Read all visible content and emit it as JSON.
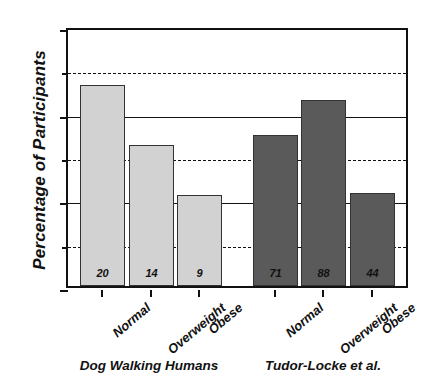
{
  "chart_data": {
    "type": "bar",
    "title": "",
    "xlabel": "",
    "ylabel": "Percentage of Participants",
    "ylim": [
      0,
      60
    ],
    "grid": "horizontal",
    "legend": "none",
    "categories": [
      "Normal",
      "Overweight",
      "Obese",
      "Normal",
      "Overweight",
      "Obese"
    ],
    "groups": [
      {
        "name": "Dog Walking Humans",
        "color": "#d2d2d2",
        "categories": [
          "Normal",
          "Overweight",
          "Obese"
        ],
        "values": [
          46.3,
          32.6,
          21.0
        ],
        "counts": [
          20,
          14,
          9
        ]
      },
      {
        "name": "Tudor-Locke et al.",
        "color": "#5a5a5a",
        "categories": [
          "Normal",
          "Overweight",
          "Obese"
        ],
        "values": [
          34.8,
          43.0,
          21.5
        ],
        "counts": [
          71,
          88,
          44
        ]
      }
    ],
    "series": [
      {
        "name": "Dog Walking Humans",
        "values": [
          46.3,
          32.6,
          21.0,
          null,
          null,
          null
        ]
      },
      {
        "name": "Tudor-Locke et al.",
        "values": [
          null,
          null,
          null,
          34.8,
          43.0,
          21.5
        ]
      }
    ],
    "y_ticks": [
      {
        "value": 0,
        "label": "0",
        "style": "solid"
      },
      {
        "value": 10,
        "label": "",
        "style": "dashed"
      },
      {
        "value": 20,
        "label": "20",
        "style": "solid"
      },
      {
        "value": 30,
        "label": "",
        "style": "dashed"
      },
      {
        "value": 40,
        "label": "40",
        "style": "solid"
      },
      {
        "value": 50,
        "label": "",
        "style": "dashed"
      },
      {
        "value": 60,
        "label": "60",
        "style": "solid"
      }
    ],
    "bar_labels": [
      "20",
      "14",
      "9",
      "71",
      "88",
      "44"
    ],
    "bars": [
      {
        "label": "Normal",
        "value": 46.3,
        "count": "20",
        "group": "Dog Walking Humans",
        "color": "#d2d2d2"
      },
      {
        "label": "Overweight",
        "value": 32.6,
        "count": "14",
        "group": "Dog Walking Humans",
        "color": "#d2d2d2"
      },
      {
        "label": "Obese",
        "value": 21.0,
        "count": "9",
        "group": "Dog Walking Humans",
        "color": "#d2d2d2"
      },
      {
        "label": "Normal",
        "value": 34.8,
        "count": "71",
        "group": "Tudor-Locke et al.",
        "color": "#5a5a5a"
      },
      {
        "label": "Overweight",
        "value": 43.0,
        "count": "88",
        "group": "Tudor-Locke et al.",
        "color": "#5a5a5a"
      },
      {
        "label": "Obese",
        "value": 21.5,
        "count": "44",
        "group": "Tudor-Locke et al.",
        "color": "#5a5a5a"
      }
    ],
    "group_labels": [
      "Dog Walking Humans",
      "Tudor-Locke et al."
    ],
    "colors": {
      "light_bar": "#d2d2d2",
      "dark_bar": "#5a5a5a",
      "axis": "#111111",
      "background": "#ffffff"
    }
  }
}
